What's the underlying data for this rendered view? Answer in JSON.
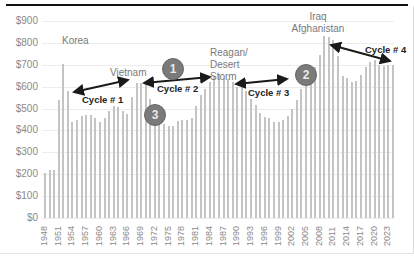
{
  "chart_data": {
    "type": "bar",
    "title": "",
    "xlabel": "",
    "ylabel": "",
    "ylim": [
      0,
      900
    ],
    "grid": true,
    "legend": "none",
    "y_tick_labels": [
      "$0",
      "$100",
      "$200",
      "$300",
      "$400",
      "$500",
      "$600",
      "$700",
      "$800",
      "$900"
    ],
    "x_tick_labels": [
      "1948",
      "1951",
      "1954",
      "1957",
      "1960",
      "1963",
      "1966",
      "1969",
      "1972",
      "1975",
      "1978",
      "1981",
      "1984",
      "1987",
      "1990",
      "1993",
      "1996",
      "1999",
      "2002",
      "2005",
      "2008",
      "2011",
      "2014",
      "2017",
      "2020",
      "2023"
    ],
    "categories": [
      1948,
      1949,
      1950,
      1951,
      1952,
      1953,
      1954,
      1955,
      1956,
      1957,
      1958,
      1959,
      1960,
      1961,
      1962,
      1963,
      1964,
      1965,
      1966,
      1967,
      1968,
      1969,
      1970,
      1971,
      1972,
      1973,
      1974,
      1975,
      1976,
      1977,
      1978,
      1979,
      1980,
      1981,
      1982,
      1983,
      1984,
      1985,
      1986,
      1987,
      1988,
      1989,
      1990,
      1991,
      1992,
      1993,
      1994,
      1995,
      1996,
      1997,
      1998,
      1999,
      2000,
      2001,
      2002,
      2003,
      2004,
      2005,
      2006,
      2007,
      2008,
      2009,
      2010,
      2011,
      2012,
      2013,
      2014,
      2015,
      2016,
      2017,
      2018,
      2019,
      2020,
      2021,
      2022,
      2023,
      2024
    ],
    "values": [
      205,
      220,
      220,
      540,
      705,
      580,
      440,
      450,
      465,
      470,
      470,
      455,
      440,
      455,
      490,
      510,
      505,
      490,
      475,
      555,
      615,
      615,
      610,
      545,
      470,
      445,
      430,
      420,
      420,
      445,
      450,
      450,
      455,
      510,
      560,
      590,
      620,
      650,
      660,
      640,
      635,
      620,
      600,
      610,
      580,
      545,
      515,
      480,
      460,
      455,
      440,
      440,
      450,
      465,
      500,
      540,
      590,
      630,
      650,
      690,
      745,
      830,
      825,
      815,
      740,
      650,
      640,
      620,
      625,
      655,
      690,
      715,
      720,
      700,
      695,
      700,
      700
    ],
    "annotations": {
      "events": [
        "Korea",
        "Vietnam",
        "Reagan/ Desert Storm",
        "Iraq Afghanistan"
      ],
      "cycles": [
        "Cycle # 1",
        "Cycle # 2",
        "Cycle # 3",
        "Cycle # 4"
      ],
      "markers": [
        "1",
        "2",
        "3"
      ]
    }
  },
  "labels": {
    "events": {
      "korea": "Korea",
      "vietnam": "Vietnam",
      "reagan_l1": "Reagan/",
      "reagan_l2": "Desert",
      "reagan_l3": "Storm",
      "iraq_l1": "Iraq",
      "iraq_l2": "Afghanistan"
    },
    "cycles": {
      "c1": "Cycle # 1",
      "c2": "Cycle # 2",
      "c3": "Cycle # 3",
      "c4": "Cycle # 4"
    },
    "markers": {
      "m1": "1",
      "m2": "2",
      "m3": "3"
    }
  },
  "colors": {
    "bar": "#c4c4c4",
    "marker": "#7a7a7a",
    "arrow": "#1a1a1a",
    "grid": "#ececec"
  }
}
